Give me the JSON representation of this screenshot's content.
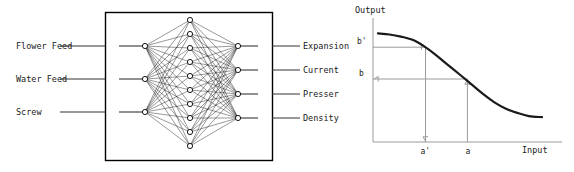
{
  "figure": {
    "left_panel": {
      "title": "neural-network-block-diagram",
      "inputs": [
        {
          "label": "Flower Feed"
        },
        {
          "label": "Water Feed"
        },
        {
          "label": "Screw"
        }
      ],
      "outputs": [
        {
          "label": "Expansion"
        },
        {
          "label": "Current"
        },
        {
          "label": "Presser"
        },
        {
          "label": "Density"
        }
      ],
      "network": {
        "input_nodes": 3,
        "hidden_nodes": 10,
        "output_nodes": 4,
        "node_radius": 2.6,
        "node_fill": "#ffffff",
        "node_stroke": "#000000",
        "edge_color": "#111111",
        "box_stroke": "#000000",
        "box": {
          "x": 105,
          "y": 12,
          "w": 167,
          "h": 148
        },
        "input_x": 145,
        "hidden_x": 190,
        "output_x": 238,
        "input_ys": [
          46,
          79,
          112
        ],
        "output_ys": [
          46,
          70,
          94,
          118
        ],
        "hidden_ys": [
          20,
          34,
          48,
          62,
          76,
          90,
          104,
          118,
          132,
          146
        ],
        "input_lead_x": 95,
        "output_lead_x": 282,
        "left_lead_x": 60,
        "right_lead_x": 300
      }
    },
    "right_panel": {
      "title": "sigmoid-transfer-curve"
    }
  },
  "chart_data": {
    "type": "line",
    "title": "",
    "xlabel": "Input",
    "ylabel": "Output",
    "grid": false,
    "legend": null,
    "xlim": [
      0,
      1
    ],
    "ylim": [
      0,
      1
    ],
    "curve_description": "monotonically decreasing sigmoid (S-curve) from high output at low input to low output at high input",
    "x": [
      0.0,
      0.07,
      0.14,
      0.21,
      0.28,
      0.35,
      0.42,
      0.5,
      0.57,
      0.64,
      0.71,
      0.78,
      0.85,
      0.92,
      1.0
    ],
    "y": [
      0.93,
      0.92,
      0.9,
      0.87,
      0.81,
      0.73,
      0.64,
      0.54,
      0.45,
      0.36,
      0.28,
      0.22,
      0.18,
      0.15,
      0.14
    ],
    "annotations": [
      {
        "name": "b-prime",
        "label": "b'",
        "axis": "y",
        "value": 0.8,
        "arrow": "to-curve-right"
      },
      {
        "name": "a-prime",
        "label": "a'",
        "axis": "x",
        "value": 0.29,
        "arrow": "to-axis-down"
      },
      {
        "name": "b",
        "label": "b",
        "axis": "y",
        "value": 0.5,
        "arrow": "to-axis-left"
      },
      {
        "name": "a",
        "label": "a",
        "axis": "x",
        "value": 0.545,
        "arrow": "to-curve-up"
      }
    ],
    "axis_color": "#9a9a9a",
    "curve_color": "#1a1a1a",
    "annotation_color": "#9a9a9a",
    "tick_labels": {
      "x": [
        "a'",
        "a"
      ],
      "y": [
        "b'",
        "b"
      ]
    }
  }
}
